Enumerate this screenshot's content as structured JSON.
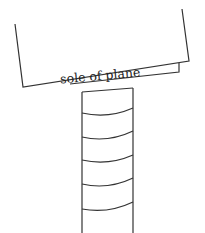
{
  "diagram": {
    "plane": {
      "label": "sole of plane",
      "rotation_deg": -5
    },
    "workpiece": {
      "description": "board edge with curved growth rings",
      "ring_count": 5
    },
    "colors": {
      "line": "#333333",
      "background": "#ffffff"
    }
  }
}
